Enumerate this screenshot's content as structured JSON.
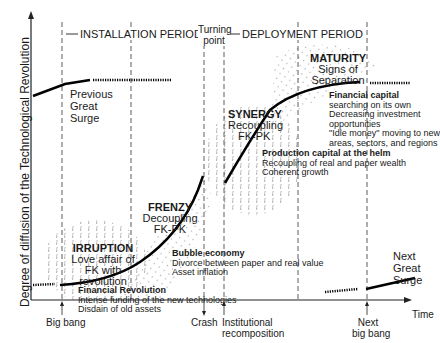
{
  "diagram": {
    "y_axis_label": "Degree of diffusion of the Technological Revolution",
    "x_axis_label": "Time",
    "periods": {
      "installation": "INSTALLATION PERIOD",
      "turning_point": [
        "Turning",
        "point"
      ],
      "deployment": "DEPLOYMENT PERIOD"
    },
    "previous_surge": [
      "Previous",
      "Great",
      "Surge"
    ],
    "next_surge": [
      "Next",
      "Great",
      "Surge"
    ],
    "phases": [
      {
        "title": "IRRUPTION",
        "lines": [
          "Love affair of",
          "FK with",
          "revolution"
        ]
      },
      {
        "title": "FRENZY",
        "lines": [
          "Decoupling",
          "FK-PK"
        ]
      },
      {
        "title": "SYNERGY",
        "lines": [
          "Recoupling",
          "FK-PK"
        ]
      },
      {
        "title": "MATURITY",
        "lines": [
          "Signs of",
          "Separation"
        ]
      }
    ],
    "notes": [
      {
        "title": "Financial Revolution",
        "lines": [
          "Intense funding of the new technologies",
          "Disdain of old assets"
        ]
      },
      {
        "title": "Bubble economy",
        "lines": [
          "Divorce between paper and real value",
          "Asset inflation"
        ]
      },
      {
        "title": "Production capital at the helm",
        "lines": [
          "Recoupling of real and paper wealth",
          "Coherent growth"
        ]
      },
      {
        "title": "Financial capital",
        "lines": [
          "searching on its own",
          "Decreasing investment",
          "opportunities",
          "\"Idle money\" moving to new",
          "areas, sectors, and regions"
        ]
      }
    ],
    "events": {
      "big_bang": "Big bang",
      "crash": "Crash",
      "institutional": [
        "Institutional",
        "recomposition"
      ],
      "next_big_bang": [
        "Next",
        "big bang"
      ]
    }
  }
}
